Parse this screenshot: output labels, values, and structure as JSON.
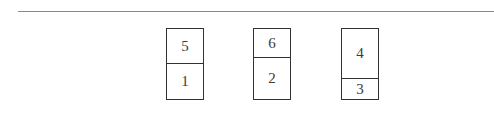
{
  "diagram": {
    "rule": {
      "color": "#8a8a8a"
    },
    "boxes": [
      {
        "top_label": "5",
        "bottom_label": "1",
        "top_fraction": 0.49
      },
      {
        "top_label": "6",
        "bottom_label": "2",
        "top_fraction": 0.4
      },
      {
        "top_label": "4",
        "bottom_label": "3",
        "top_fraction": 0.7
      }
    ]
  }
}
